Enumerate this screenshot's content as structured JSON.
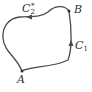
{
  "diagram": {
    "type": "closed-curve-path",
    "stroke_color": "#4a4a4a",
    "points": [
      {
        "id": "A",
        "label": "A",
        "x": 22,
        "y": 71
      },
      {
        "id": "B",
        "label": "B",
        "x": 69,
        "y": 11
      }
    ],
    "paths": [
      {
        "id": "C1",
        "label_main": "C",
        "label_sub": "1",
        "label_sup": "",
        "from": "A",
        "to": "B",
        "direction": "up"
      },
      {
        "id": "C2star",
        "label_main": "C",
        "label_sub": "2",
        "label_sup": "*",
        "from": "B",
        "to": "A",
        "direction": "left"
      }
    ]
  }
}
